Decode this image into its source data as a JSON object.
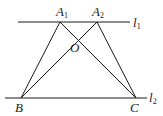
{
  "diagram": {
    "lines": {
      "l1": {
        "label": "l",
        "sub": "1",
        "x1": 18,
        "y1": 22,
        "x2": 130,
        "y2": 22
      },
      "l2": {
        "label": "l",
        "sub": "2",
        "x1": 5,
        "y1": 98,
        "x2": 147,
        "y2": 98
      }
    },
    "points": {
      "A1": {
        "label": "A",
        "sub": "1",
        "x": 60,
        "y": 22
      },
      "A2": {
        "label": "A",
        "sub": "2",
        "x": 97,
        "y": 22
      },
      "B": {
        "label": "B",
        "x": 21,
        "y": 98
      },
      "C": {
        "label": "C",
        "x": 136,
        "y": 98
      },
      "O": {
        "label": "O",
        "x": 75,
        "y": 38
      }
    },
    "segments": [
      [
        "A1",
        "B"
      ],
      [
        "A1",
        "C"
      ],
      [
        "A2",
        "B"
      ],
      [
        "A2",
        "C"
      ]
    ]
  }
}
